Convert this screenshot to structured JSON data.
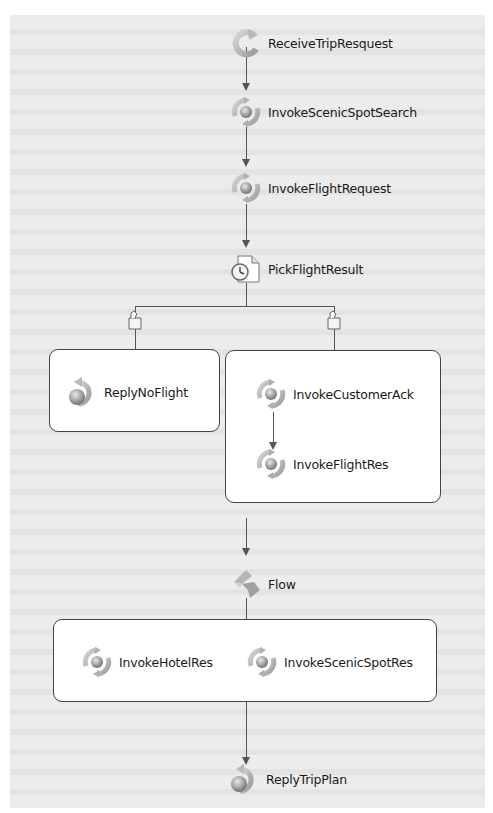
{
  "diagram": {
    "type": "BPEL process flow",
    "nodes": [
      {
        "id": "receive",
        "label": "ReceiveTripResquest",
        "kind": "receive"
      },
      {
        "id": "invoke_scenic_search",
        "label": "InvokeScenicSpotSearch",
        "kind": "invoke"
      },
      {
        "id": "invoke_flight_request",
        "label": "InvokeFlightRequest",
        "kind": "invoke"
      },
      {
        "id": "pick",
        "label": "PickFlightResult",
        "kind": "pick"
      },
      {
        "id": "reply_no_flight",
        "label": "ReplyNoFlight",
        "kind": "reply"
      },
      {
        "id": "invoke_customer_ack",
        "label": "InvokeCustomerAck",
        "kind": "invoke"
      },
      {
        "id": "invoke_flight_res",
        "label": "InvokeFlightRes",
        "kind": "invoke"
      },
      {
        "id": "flow",
        "label": "Flow",
        "kind": "flow"
      },
      {
        "id": "invoke_hotel_res",
        "label": "InvokeHotelRes",
        "kind": "invoke"
      },
      {
        "id": "invoke_scenic_res",
        "label": "InvokeScenicSpotRes",
        "kind": "invoke"
      },
      {
        "id": "reply_trip_plan",
        "label": "ReplyTripPlan",
        "kind": "reply"
      }
    ],
    "edges": [
      [
        "receive",
        "invoke_scenic_search"
      ],
      [
        "invoke_scenic_search",
        "invoke_flight_request"
      ],
      [
        "invoke_flight_request",
        "pick"
      ],
      [
        "pick",
        "reply_no_flight"
      ],
      [
        "pick",
        "invoke_customer_ack"
      ],
      [
        "invoke_customer_ack",
        "invoke_flight_res"
      ],
      [
        "pick",
        "flow"
      ],
      [
        "flow",
        "invoke_hotel_res"
      ],
      [
        "flow",
        "invoke_scenic_res"
      ],
      [
        "flow",
        "reply_trip_plan"
      ]
    ],
    "branches": {
      "pick_left": "ReplyNoFlight",
      "pick_right": [
        "InvokeCustomerAck",
        "InvokeFlightRes"
      ],
      "flow_parallel": [
        "InvokeHotelRes",
        "InvokeScenicSpotRes"
      ]
    },
    "icons": {
      "receive": "receive-activity-icon",
      "invoke": "invoke-activity-icon",
      "pick": "pick-timer-icon",
      "reply": "reply-activity-icon",
      "flow": "flow-activity-icon",
      "case": "on-message-case-icon"
    }
  }
}
